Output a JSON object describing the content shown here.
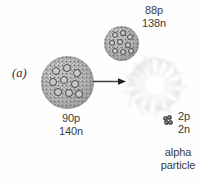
{
  "figure": {
    "panel_letter": "(a)",
    "background_color": "#fefefe",
    "text_color": "#3a3a3a"
  },
  "parent_nucleus": {
    "name": "parent-nucleus",
    "protons_label": "90p",
    "neutrons_label": "140n",
    "nucleon_count": 9,
    "fill_color": "#b9b9b9",
    "outline_color": "#4a4a4a"
  },
  "daughter_nucleus": {
    "name": "daughter-nucleus",
    "protons_label": "88p",
    "neutrons_label": "138n",
    "nucleon_count": 9,
    "fill_color": "#b9b9b9",
    "outline_color": "#4a4a4a"
  },
  "alpha_particle": {
    "protons_label": "2p",
    "neutrons_label": "2n",
    "name_line_1": "alpha",
    "name_line_2": "particle",
    "nucleon_count": 4,
    "fill_color": "#4c4c4c"
  },
  "arrow": {
    "name": "decay-arrow",
    "direction": "right",
    "color": "#404040"
  },
  "starburst": {
    "name": "explosion-burst",
    "spike_count": 14,
    "fill_color": "#ffffff",
    "shade_color": "#d9d9d9"
  }
}
